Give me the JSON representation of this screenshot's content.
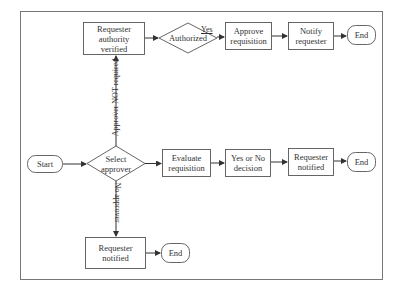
{
  "diagram": {
    "colors": {
      "stroke": "#555555",
      "text": "#333333",
      "background": "#ffffff"
    },
    "nodes": {
      "start": {
        "label": "Start",
        "shape": "terminal"
      },
      "select_approver": {
        "label": "Select approver",
        "line1": "Select",
        "line2": "approver",
        "shape": "decision"
      },
      "authority_verified": {
        "label": "Requester authority verified",
        "line1": "Requester",
        "line2": "authority",
        "line3": "verified",
        "shape": "process"
      },
      "authorized": {
        "label": "Authorized",
        "shape": "decision"
      },
      "approve_requisition": {
        "label": "Approve requisition",
        "line1": "Approve",
        "line2": "requisition",
        "shape": "process"
      },
      "notify_requester": {
        "label": "Notify requester",
        "line1": "Notify",
        "line2": "requester",
        "shape": "process"
      },
      "end_top": {
        "label": "End",
        "shape": "terminal"
      },
      "evaluate_requisition": {
        "label": "Evaluate requisition",
        "line1": "Evaluate",
        "line2": "requisition",
        "shape": "process"
      },
      "yes_no_decision": {
        "label": "Yes or No decision",
        "line1": "Yes or No",
        "line2": "decision",
        "shape": "process"
      },
      "requester_notified_mid": {
        "label": "Requester notified",
        "line1": "Requester",
        "line2": "notified",
        "shape": "process"
      },
      "end_mid": {
        "label": "End",
        "shape": "terminal"
      },
      "requester_notified_bottom": {
        "label": "Requester notified",
        "line1": "Requester",
        "line2": "notified",
        "shape": "process"
      },
      "end_bottom": {
        "label": "End",
        "shape": "terminal"
      }
    },
    "edge_labels": {
      "yes": "Yes",
      "approver_not_required": "Approver NOT required",
      "no_approver": "No approver"
    },
    "edges": [
      {
        "from": "start",
        "to": "select_approver"
      },
      {
        "from": "select_approver",
        "to": "authority_verified",
        "label": "Approver NOT required"
      },
      {
        "from": "select_approver",
        "to": "evaluate_requisition"
      },
      {
        "from": "select_approver",
        "to": "requester_notified_bottom",
        "label": "No approver"
      },
      {
        "from": "authority_verified",
        "to": "authorized"
      },
      {
        "from": "authorized",
        "to": "approve_requisition",
        "label": "Yes"
      },
      {
        "from": "approve_requisition",
        "to": "notify_requester"
      },
      {
        "from": "notify_requester",
        "to": "end_top"
      },
      {
        "from": "evaluate_requisition",
        "to": "yes_no_decision"
      },
      {
        "from": "yes_no_decision",
        "to": "requester_notified_mid"
      },
      {
        "from": "requester_notified_mid",
        "to": "end_mid"
      },
      {
        "from": "requester_notified_bottom",
        "to": "end_bottom"
      }
    ]
  }
}
